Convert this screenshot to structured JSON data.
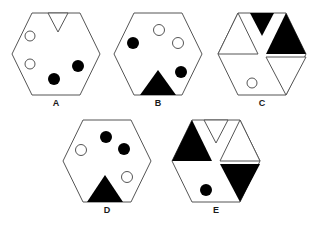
{
  "page": {
    "background_color": "#ffffff",
    "stroke_color": "#555555",
    "fill_black": "#000000",
    "fill_white": "#ffffff",
    "width": 313,
    "height": 226
  },
  "figures": [
    {
      "id": "A",
      "label": "A",
      "x": 10,
      "y": 10,
      "shapes": {
        "triangles": [
          {
            "name": "triangle-top-center",
            "position": "top-center",
            "direction": "down",
            "fill": "white"
          }
        ],
        "circles": [
          {
            "name": "circle-upper-left",
            "position": "upper-left",
            "fill": "white"
          },
          {
            "name": "circle-lower-left",
            "position": "lower-left",
            "fill": "white"
          },
          {
            "name": "circle-right",
            "position": "right-lower",
            "fill": "black"
          },
          {
            "name": "circle-bottom-center",
            "position": "bottom-center",
            "fill": "black"
          }
        ]
      }
    },
    {
      "id": "B",
      "label": "B",
      "x": 112,
      "y": 10,
      "shapes": {
        "triangles": [
          {
            "name": "triangle-bottom-center",
            "position": "bottom-center",
            "direction": "up",
            "fill": "black"
          }
        ],
        "circles": [
          {
            "name": "circle-top-center",
            "position": "top-center",
            "fill": "white"
          },
          {
            "name": "circle-upper-right",
            "position": "upper-right",
            "fill": "white"
          },
          {
            "name": "circle-upper-left",
            "position": "upper-left",
            "fill": "black"
          },
          {
            "name": "circle-lower-right",
            "position": "lower-right",
            "fill": "black"
          }
        ]
      }
    },
    {
      "id": "C",
      "label": "C",
      "x": 214,
      "y": 10,
      "shapes": {
        "triangles": [
          {
            "name": "triangle-top-center",
            "position": "top-center",
            "direction": "down",
            "fill": "black"
          },
          {
            "name": "triangle-upper-right",
            "position": "upper-right",
            "direction": "up",
            "fill": "black"
          },
          {
            "name": "triangle-upper-left",
            "position": "upper-left",
            "direction": "up",
            "fill": "white"
          },
          {
            "name": "triangle-lower-right",
            "position": "lower-right",
            "direction": "down",
            "fill": "white"
          }
        ],
        "circles": [
          {
            "name": "circle-bottom-center",
            "position": "bottom-center",
            "fill": "white"
          }
        ]
      }
    },
    {
      "id": "D",
      "label": "D",
      "x": 61,
      "y": 117,
      "shapes": {
        "triangles": [
          {
            "name": "triangle-bottom-center",
            "position": "bottom-center",
            "direction": "up",
            "fill": "black"
          }
        ],
        "circles": [
          {
            "name": "circle-top-center",
            "position": "top-center",
            "fill": "black"
          },
          {
            "name": "circle-upper-right",
            "position": "upper-right",
            "fill": "black"
          },
          {
            "name": "circle-upper-left",
            "position": "upper-left",
            "fill": "white"
          },
          {
            "name": "circle-lower-right",
            "position": "lower-right",
            "fill": "white"
          }
        ]
      }
    },
    {
      "id": "E",
      "label": "E",
      "x": 168,
      "y": 117,
      "shapes": {
        "triangles": [
          {
            "name": "triangle-upper-left",
            "position": "upper-left",
            "direction": "up",
            "fill": "black"
          },
          {
            "name": "triangle-top-center",
            "position": "top-center",
            "direction": "down",
            "fill": "white"
          },
          {
            "name": "triangle-upper-right",
            "position": "upper-right",
            "direction": "up",
            "fill": "white"
          },
          {
            "name": "triangle-lower-right",
            "position": "lower-right",
            "direction": "down",
            "fill": "black"
          }
        ],
        "circles": [
          {
            "name": "circle-bottom-center",
            "position": "bottom-center",
            "fill": "black"
          }
        ]
      }
    }
  ]
}
